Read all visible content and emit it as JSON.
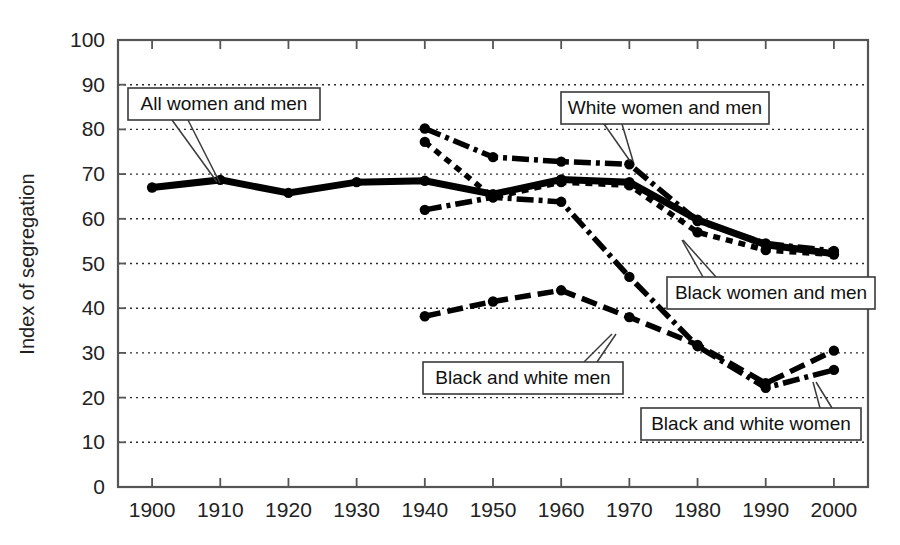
{
  "chart_data": {
    "type": "line",
    "title": "",
    "xlabel": "",
    "ylabel": "Index of segregation",
    "xlim": [
      1895,
      2005
    ],
    "ylim": [
      0,
      100
    ],
    "grid": true,
    "legend": "inline-callouts",
    "x_ticks": [
      1900,
      1910,
      1920,
      1930,
      1940,
      1950,
      1960,
      1970,
      1980,
      1990,
      2000
    ],
    "y_ticks": [
      0,
      10,
      20,
      30,
      40,
      50,
      60,
      70,
      80,
      90,
      100
    ],
    "series": [
      {
        "name": "All women and men",
        "style": "solid",
        "x": [
          1900,
          1910,
          1920,
          1930,
          1940,
          1950,
          1960,
          1970,
          1980,
          1990,
          2000
        ],
        "values": [
          67.0,
          68.7,
          65.8,
          68.2,
          68.5,
          65.5,
          68.8,
          68.2,
          59.8,
          54.2,
          52.2
        ]
      },
      {
        "name": "White women and men",
        "style": "dash-dot",
        "x": [
          1940,
          1950,
          1960,
          1970,
          1980,
          1990,
          2000
        ],
        "values": [
          80.2,
          73.8,
          72.8,
          72.2,
          59.5,
          54.5,
          52.8
        ]
      },
      {
        "name": "Black women and men",
        "style": "dotted",
        "x": [
          1940,
          1950,
          1960,
          1970,
          1980,
          1990,
          2000
        ],
        "values": [
          77.2,
          64.8,
          68.2,
          67.5,
          57.0,
          53.0,
          52.0
        ]
      },
      {
        "name": "Black and white men",
        "style": "dashed",
        "x": [
          1940,
          1950,
          1960,
          1970,
          1980,
          1990,
          2000
        ],
        "values": [
          38.2,
          41.5,
          44.0,
          38.0,
          31.8,
          23.2,
          30.5
        ]
      },
      {
        "name": "Black and white women",
        "style": "dash-dot",
        "x": [
          1940,
          1950,
          1960,
          1970,
          1980,
          1990,
          2000
        ],
        "values": [
          62.0,
          64.8,
          63.8,
          47.0,
          31.5,
          22.2,
          26.2
        ]
      }
    ],
    "callouts": [
      {
        "label": "All women and men",
        "box": {
          "x": 128,
          "y": 88,
          "w": 192,
          "h": 32
        },
        "leaders": [
          {
            "x1": 172,
            "y1": 120,
            "x2": 217,
            "y2": 182
          },
          {
            "x1": 188,
            "y1": 120,
            "x2": 220,
            "y2": 183
          }
        ]
      },
      {
        "label": "White women and men",
        "box": {
          "x": 561,
          "y": 92,
          "w": 208,
          "h": 32
        },
        "leaders": [
          {
            "x1": 603,
            "y1": 124,
            "x2": 608,
            "y2": 124
          },
          {
            "x1": 604,
            "y1": 124,
            "x2": 630,
            "y2": 161
          },
          {
            "x1": 622,
            "y1": 124,
            "x2": 633,
            "y2": 161
          }
        ]
      },
      {
        "label": "Black women and men",
        "box": {
          "x": 667,
          "y": 277,
          "w": 208,
          "h": 32
        },
        "leaders": [
          {
            "x1": 703,
            "y1": 277,
            "x2": 682,
            "y2": 240
          },
          {
            "x1": 716,
            "y1": 277,
            "x2": 683,
            "y2": 240
          }
        ]
      },
      {
        "label": "Black and white men",
        "box": {
          "x": 423,
          "y": 362,
          "w": 200,
          "h": 32
        },
        "leaders": [
          {
            "x1": 584,
            "y1": 362,
            "x2": 612,
            "y2": 334
          },
          {
            "x1": 597,
            "y1": 362,
            "x2": 616,
            "y2": 334
          }
        ]
      },
      {
        "label": "Black and white women",
        "box": {
          "x": 641,
          "y": 408,
          "w": 220,
          "h": 32
        },
        "leaders": [
          {
            "x1": 820,
            "y1": 408,
            "x2": 813,
            "y2": 382
          },
          {
            "x1": 832,
            "y1": 408,
            "x2": 816,
            "y2": 382
          }
        ]
      }
    ]
  },
  "plot": {
    "left": 118,
    "right": 868,
    "top": 40,
    "bottom": 487
  }
}
